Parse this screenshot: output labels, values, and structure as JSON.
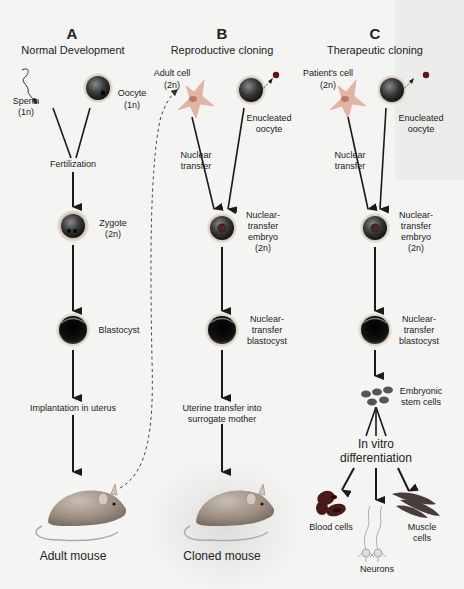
{
  "columns": [
    {
      "letter": "A",
      "title": "Normal Development",
      "labels": {
        "sperm": "Sperm",
        "sperm_ploidy": "(1n)",
        "oocyte": "Oocyte",
        "oocyte_ploidy": "(1n)",
        "fertilization": "Fertilization",
        "zygote": "Zygote",
        "zygote_ploidy": "(2n)",
        "blastocyst": "Blastocyst",
        "implantation": "Implantation in uterus",
        "result": "Adult mouse"
      }
    },
    {
      "letter": "B",
      "title": "Reproductive cloning",
      "labels": {
        "donor_cell": "Adult cell",
        "donor_ploidy": "(2n)",
        "enucleated_1": "Enucleated",
        "enucleated_2": "oocyte",
        "nuclear_transfer_1": "Nuclear",
        "nuclear_transfer_2": "transfer",
        "embryo_1": "Nuclear-",
        "embryo_2": "transfer",
        "embryo_3": "embryo",
        "embryo_4": "(2n)",
        "blastocyst_1": "Nuclear-",
        "blastocyst_2": "transfer",
        "blastocyst_3": "blastocyst",
        "uterine_1": "Uterine transfer into",
        "uterine_2": "surrogate mother",
        "result": "Cloned mouse"
      }
    },
    {
      "letter": "C",
      "title": "Therapeutic cloning",
      "labels": {
        "donor_cell": "Patient's cell",
        "donor_ploidy": "(2n)",
        "enucleated_1": "Enucleated",
        "enucleated_2": "oocyte",
        "nuclear_transfer_1": "Nuclear",
        "nuclear_transfer_2": "transfer",
        "embryo_1": "Nuclear-",
        "embryo_2": "transfer",
        "embryo_3": "embryo",
        "embryo_4": "(2n)",
        "blastocyst_1": "Nuclear-",
        "blastocyst_2": "transfer",
        "blastocyst_3": "blastocyst",
        "stem_1": "Embryonic",
        "stem_2": "stem cells",
        "invitro_1": "In vitro",
        "invitro_2": "differentiation",
        "blood": "Blood cells",
        "neurons": "Neurons",
        "muscle_1": "Muscle",
        "muscle_2": "cells"
      }
    }
  ],
  "colors": {
    "background": "#f4f4f2",
    "arrow": "#1a1a1a",
    "cell_ring": "#d9c4b4",
    "cell_dark": "#2a2a2a",
    "donor_cell": "#e6b4a4",
    "blood_cell": "#5a1f1f",
    "muscle_cell": "#4a3a3a",
    "mouse": "#9a8a7a"
  }
}
